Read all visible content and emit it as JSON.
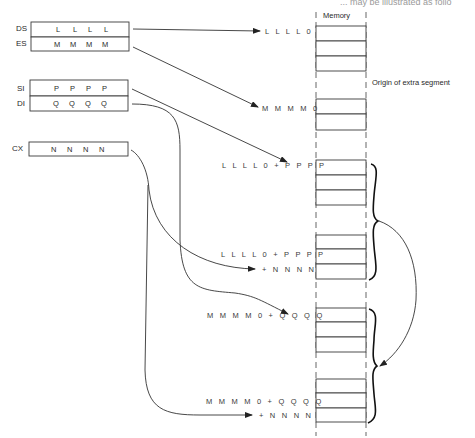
{
  "top_cut_text": "... may be illustrated as follo",
  "memory": {
    "title": "Memory",
    "extra_segment_note": "Origin of extra segment"
  },
  "registers": [
    {
      "name": "DS",
      "values": [
        "L",
        "L",
        "L",
        "L"
      ]
    },
    {
      "name": "ES",
      "values": [
        "M",
        "M",
        "M",
        "M"
      ]
    },
    {
      "name": "SI",
      "values": [
        "P",
        "P",
        "P",
        "P"
      ]
    },
    {
      "name": "DI",
      "values": [
        "Q",
        "Q",
        "Q",
        "Q"
      ]
    },
    {
      "name": "CX",
      "values": [
        "N",
        "N",
        "N",
        "N"
      ]
    }
  ],
  "addresses": [
    {
      "id": "ds-origin",
      "lines": [
        "L L L L 0"
      ]
    },
    {
      "id": "es-origin",
      "lines": [
        "M M M M 0"
      ]
    },
    {
      "id": "source-start",
      "lines": [
        "L L L L 0 + P P P P"
      ]
    },
    {
      "id": "source-end",
      "lines": [
        "L L L L 0 + P P P P",
        "+ N N N N"
      ]
    },
    {
      "id": "dest-start",
      "lines": [
        "M M M M 0 + Q Q Q Q"
      ]
    },
    {
      "id": "dest-end",
      "lines": [
        "M M M M 0 + Q Q Q Q",
        "+ N N N N"
      ]
    }
  ]
}
